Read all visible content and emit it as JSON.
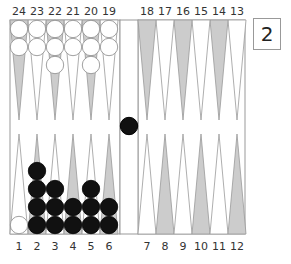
{
  "board": {
    "top_labels": [
      "24",
      "23",
      "22",
      "21",
      "20",
      "19",
      "18",
      "17",
      "16",
      "15",
      "14",
      "13"
    ],
    "bottom_labels": [
      "1",
      "2",
      "3",
      "4",
      "5",
      "6",
      "7",
      "8",
      "9",
      "10",
      "11",
      "12"
    ],
    "colors": {
      "light_point": "#ffffff",
      "dark_point": "#cccccc",
      "line": "#999999",
      "white_checker": "#ffffff",
      "black_checker": "#111111"
    },
    "points": {
      "24": {
        "color": "white",
        "count": 2
      },
      "23": {
        "color": "white",
        "count": 2
      },
      "22": {
        "color": "white",
        "count": 3
      },
      "21": {
        "color": "white",
        "count": 2
      },
      "20": {
        "color": "white",
        "count": 3
      },
      "19": {
        "color": "white",
        "count": 2
      },
      "1": {
        "color": "white",
        "count": 1
      },
      "2": {
        "color": "black",
        "count": 4
      },
      "3": {
        "color": "black",
        "count": 3
      },
      "4": {
        "color": "black",
        "count": 2
      },
      "5": {
        "color": "black",
        "count": 3
      },
      "6": {
        "color": "black",
        "count": 2
      }
    },
    "bar": {
      "black": 1,
      "white": 0
    }
  },
  "doubling_cube": {
    "value": "2"
  }
}
